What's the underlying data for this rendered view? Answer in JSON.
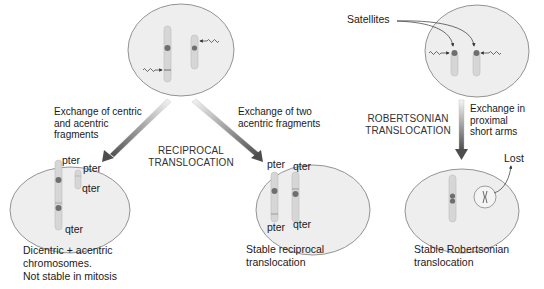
{
  "figure": {
    "type": "diagram",
    "colors": {
      "cell_fill": "#eeeeee",
      "cell_stroke": "#7a7a7a",
      "chromosome_fill": "#d6d6d6",
      "centromere": "#6f6f6f",
      "arrow_dark": "#555555",
      "arrow_light": "#f4f4f4"
    }
  },
  "reciprocal": {
    "heading_line1": "RECIPROCAL",
    "heading_line2": "TRANSLOCATION",
    "left_branch": {
      "label_line1": "Exchange of centric",
      "label_line2": "and acentric",
      "label_line3": "fragments",
      "result_terms": [
        "pter",
        "pter",
        "qter",
        "qter"
      ],
      "caption_line1": "Dicentric + acentric",
      "caption_line2": "chromosomes.",
      "caption_line3": "Not stable in mitosis"
    },
    "right_branch": {
      "label_line1": "Exchange of two",
      "label_line2": "acentric fragments",
      "result_terms": [
        "pter",
        "qter",
        "pter",
        "qter"
      ],
      "caption_line1": "Stable reciprocal",
      "caption_line2": "translocation"
    }
  },
  "robertsonian": {
    "heading_line1": "ROBERTSONIAN",
    "heading_line2": "TRANSLOCATION",
    "satellites_label": "Satellites",
    "arrow_label_line1": "Exchange in",
    "arrow_label_line2": "proximal",
    "arrow_label_line3": "short arms",
    "lost_label": "Lost",
    "caption_line1": "Stable Robertsonian",
    "caption_line2": "translocation"
  }
}
